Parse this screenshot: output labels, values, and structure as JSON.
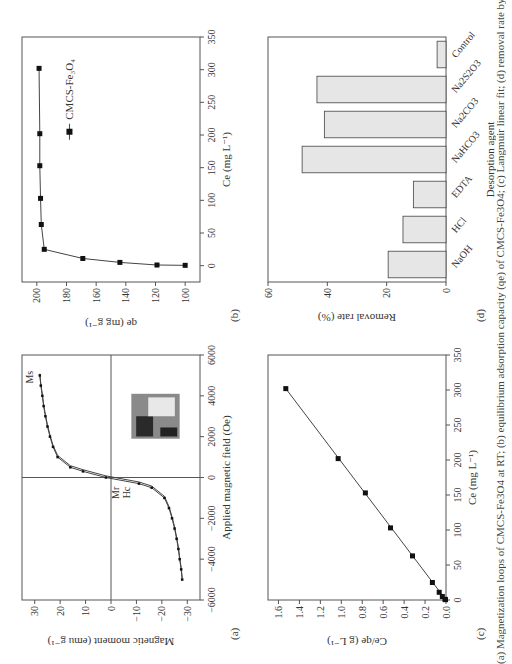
{
  "figure": {
    "caption": "(a) Magnetization loops of CMCS-Fe3O4 at RT; (b) equilibrium adsorption capacity (qe) of CMCS-Fe3O4; (c) Langmuir linear fit; (d) removal rate by desorption agent",
    "panels": {
      "a": {
        "label": "(a)",
        "xlabel": "Applied magnetic field (Oe)",
        "ylabel": "Magnetic moment (emu g⁻¹)",
        "annot_ms": "Ms",
        "annot_mr": "Mr",
        "annot_hc": "Hc"
      },
      "b": {
        "label": "(b)",
        "xlabel": "Ce (mg L⁻¹)",
        "ylabel": "qe (mg g⁻¹)",
        "legend": "CMCS-Fe₃O₄"
      },
      "c": {
        "label": "(c)",
        "xlabel": "Ce (mg L⁻¹)",
        "ylabel": "Ce/qe (g L⁻¹)"
      },
      "d": {
        "label": "(d)",
        "xlabel": "Desorption agent",
        "ylabel": "Removal rate (%)"
      }
    }
  },
  "chart_data": [
    {
      "id": "a",
      "type": "line",
      "title": "",
      "xlabel": "Applied magnetic field (Oe)",
      "ylabel": "Magnetic moment (emu g-1)",
      "xlim": [
        -6000,
        6000
      ],
      "ylim": [
        -35,
        35
      ],
      "xticks": [
        -6000,
        -4000,
        -2000,
        0,
        2000,
        4000,
        6000
      ],
      "yticks": [
        -30,
        -20,
        -10,
        0,
        10,
        20,
        30
      ],
      "annotations": [
        "Ms",
        "Mr",
        "Hc"
      ],
      "inset": "photo of vials with magnet",
      "series": [
        {
          "name": "hysteresis",
          "x": [
            -5000,
            -4500,
            -4000,
            -3500,
            -3000,
            -2500,
            -2000,
            -1500,
            -1000,
            -500,
            -300,
            0,
            300,
            500,
            1000,
            1500,
            2000,
            2500,
            3000,
            3500,
            4000,
            4500,
            5000
          ],
          "y": [
            -28,
            -27.6,
            -27,
            -26.5,
            -25.8,
            -25,
            -24,
            -22.8,
            -21,
            -16,
            -11,
            2,
            11,
            16,
            21,
            22.8,
            24,
            25,
            25.8,
            26.5,
            27,
            27.6,
            28
          ]
        }
      ]
    },
    {
      "id": "b",
      "type": "line",
      "xlabel": "Ce (mg L-1)",
      "ylabel": "qe (mg g-1)",
      "xlim": [
        -25,
        350
      ],
      "ylim": [
        90,
        210
      ],
      "xticks": [
        0,
        50,
        100,
        150,
        200,
        250,
        300,
        350
      ],
      "yticks": [
        100,
        120,
        140,
        160,
        180,
        200
      ],
      "legend": [
        "CMCS-Fe3O4"
      ],
      "series": [
        {
          "name": "CMCS-Fe3O4",
          "x": [
            0.5,
            1,
            5,
            11,
            25,
            63,
            103,
            153,
            202,
            302
          ],
          "y": [
            100,
            119,
            144,
            169,
            195,
            197,
            197.5,
            198,
            198,
            198.5
          ]
        }
      ]
    },
    {
      "id": "c",
      "type": "line",
      "xlabel": "Ce (mg L-1)",
      "ylabel": "Ce/qe (g L-1)",
      "xlim": [
        0,
        350
      ],
      "ylim": [
        0,
        1.7
      ],
      "xticks": [
        0,
        50,
        100,
        150,
        200,
        250,
        300,
        350
      ],
      "yticks": [
        0.0,
        0.2,
        0.4,
        0.6,
        0.8,
        1.0,
        1.2,
        1.4,
        1.6
      ],
      "series": [
        {
          "name": "CMCS-Fe3O4",
          "x": [
            0.5,
            1,
            5,
            11,
            25,
            63,
            103,
            153,
            202,
            302
          ],
          "y": [
            0.005,
            0.01,
            0.035,
            0.065,
            0.13,
            0.32,
            0.53,
            0.77,
            1.03,
            1.53
          ]
        }
      ]
    },
    {
      "id": "d",
      "type": "bar",
      "xlabel": "Desorption agent",
      "ylabel": "Removal rate (%)",
      "ylim": [
        0,
        60
      ],
      "yticks": [
        0,
        20,
        40,
        60
      ],
      "categories": [
        "NaOH",
        "HCl",
        "EDTA",
        "NaHCO3",
        "Na2CO3",
        "Na2S2O3",
        "Control"
      ],
      "values": [
        19.5,
        14.5,
        11,
        48.5,
        41,
        43.5,
        3
      ]
    }
  ]
}
